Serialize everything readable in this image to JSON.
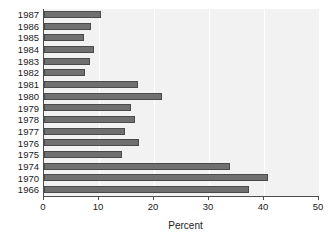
{
  "chart_data": {
    "type": "bar",
    "orientation": "horizontal",
    "title": "",
    "xlabel": "Percent",
    "ylabel": "",
    "categories": [
      "1987",
      "1986",
      "1985",
      "1984",
      "1983",
      "1982",
      "1981",
      "1980",
      "1979",
      "1978",
      "1977",
      "1976",
      "1975",
      "1974",
      "1970",
      "1966"
    ],
    "values": [
      10.3,
      8.5,
      7.2,
      9.0,
      8.3,
      7.4,
      17.0,
      21.4,
      15.9,
      16.5,
      14.8,
      17.2,
      14.2,
      33.8,
      40.8,
      37.2
    ],
    "xlim": [
      0,
      50
    ],
    "xticks": [
      0,
      10,
      20,
      30,
      40,
      50
    ],
    "xtick_labels": [
      "0",
      "10",
      "20",
      "30",
      "40",
      "50"
    ],
    "grid": "vertical-white-gridlines",
    "legend": "none",
    "colors": {
      "bar_fill": "#707070",
      "bar_edge": "#4a4a4a",
      "plot_background": "#f2f2f2",
      "gridline": "#ffffff",
      "axis": "#4d4d4d",
      "text": "#1a1a1a",
      "figure_background": "#ffffff"
    }
  }
}
